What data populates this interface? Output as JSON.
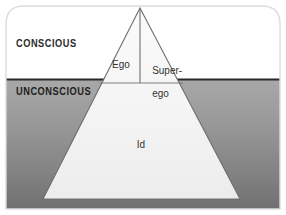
{
  "diagram": {
    "type": "iceberg-pyramid",
    "regions": [
      {
        "id": "conscious",
        "label": "CONSCIOUS",
        "fill": "#ffffff",
        "position": "above waterline"
      },
      {
        "id": "unconscious",
        "label": "UNCONSCIOUS",
        "fill": "#9a9a9a",
        "position": "below waterline"
      }
    ],
    "structures": [
      {
        "id": "ego",
        "label": "Ego",
        "region": "conscious",
        "side": "left"
      },
      {
        "id": "superego",
        "label_line1": "Super-",
        "label_line2": "ego",
        "label": "Super-ego",
        "region": "conscious",
        "side": "right"
      },
      {
        "id": "id",
        "label": "Id",
        "region": "unconscious",
        "side": "base"
      }
    ],
    "colors": {
      "conscious_fill": "#ffffff",
      "unconscious_top": "#a3a3a3",
      "unconscious_bottom": "#6f6f6f",
      "pyramid_fill": "#f2f2f2",
      "pyramid_stroke": "#6b6b6b",
      "waterline": "#2a2a2a",
      "frame_border": "#d8d8d8",
      "text_dark": "#2b2b2b"
    },
    "geometry": {
      "apex": [
        140,
        8
      ],
      "base_left": [
        43,
        199
      ],
      "base_right": [
        240,
        199
      ],
      "waterline_y": 79,
      "pyramid_divider_y": 83,
      "vertical_divider_x": 140
    }
  }
}
